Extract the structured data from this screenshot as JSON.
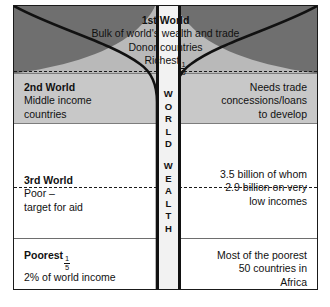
{
  "diagram": {
    "center_channel": {
      "word_top": "WORLD",
      "word_bottom": "WEALTH"
    },
    "bands": {
      "first_world": {
        "heading": "1st World",
        "line2": "Bulk of world's wealth and trade",
        "line3": "Donor countries",
        "line4_prefix": "Richest",
        "fraction_numerator": "1",
        "fraction_denominator": "5"
      },
      "second_world": {
        "heading": "2nd World",
        "left_line2": "Middle income",
        "left_line3": "countries",
        "right_line1": "Needs trade",
        "right_line2": "concessions/loans",
        "right_line3": "to develop"
      },
      "third_world": {
        "heading": "3rd World",
        "left_line2": "Poor –",
        "left_line3": "target for aid",
        "right_line1": "3.5 billion of whom",
        "right_line2": "2.9 billion on very",
        "right_line3": "low incomes"
      },
      "poorest": {
        "heading_prefix": "Poorest",
        "fraction_numerator": "1",
        "fraction_denominator": "5",
        "left_line2": "2% of world income",
        "right_line1": "Most of the poorest",
        "right_line2": "50 countries in",
        "right_line3": "Africa"
      }
    },
    "colors": {
      "band_first_bg": "#b9b9b9",
      "band_second_bg": "#c8c8c8",
      "wedge_dark": "#6f6f6f",
      "channel_bg": "#f2f2f2",
      "outline": "#111111"
    }
  }
}
